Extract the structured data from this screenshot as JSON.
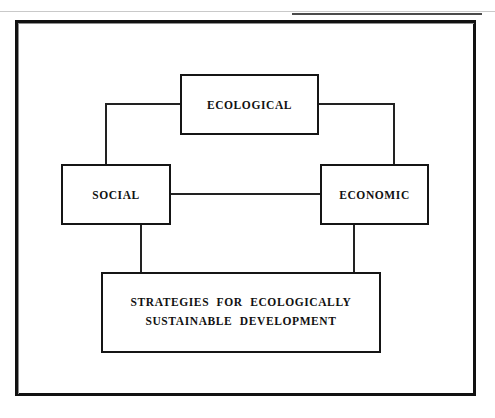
{
  "diagram": {
    "nodes": {
      "ecological": {
        "label": "ECOLOGICAL"
      },
      "social": {
        "label": "SOCIAL"
      },
      "economic": {
        "label": "ECONOMIC"
      },
      "strategies": {
        "label": "STRATEGIES  FOR  ECOLOGICALLY\nSUSTAINABLE  DEVELOPMENT"
      }
    },
    "connectors": [
      {
        "from": "ecological",
        "to": "social",
        "style": "elbow"
      },
      {
        "from": "ecological",
        "to": "economic",
        "style": "elbow"
      },
      {
        "from": "social",
        "to": "economic",
        "style": "straight"
      },
      {
        "from": "social",
        "to": "strategies",
        "style": "straight"
      },
      {
        "from": "economic",
        "to": "strategies",
        "style": "straight"
      }
    ],
    "colors": {
      "line": "#222222",
      "box_border": "#151515",
      "frame_border": "#111111",
      "text": "#111111",
      "background": "#ffffff"
    }
  }
}
